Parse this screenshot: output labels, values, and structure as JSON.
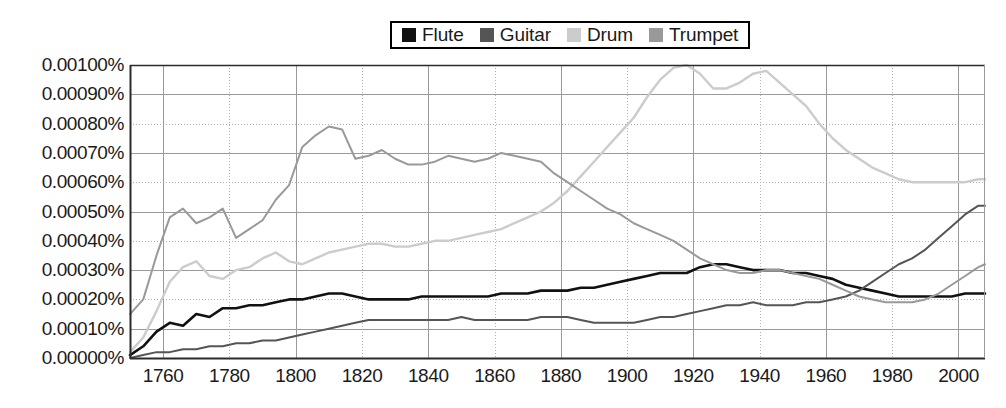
{
  "chart_data": {
    "type": "line",
    "title": "",
    "subtitle": "",
    "xlabel": "",
    "ylabel": "",
    "xlim": [
      1750,
      2008
    ],
    "ylim": [
      0.0,
      0.001
    ],
    "grid": true,
    "legend_position": "top-center",
    "y_tick_labels": [
      "0.00100%",
      "0.00090%",
      "0.00080%",
      "0.00070%",
      "0.00060%",
      "0.00050%",
      "0.00040%",
      "0.00030%",
      "0.00020%",
      "0.00010%",
      "0.00000%"
    ],
    "y_tick_values": [
      0.001,
      0.0009,
      0.0008,
      0.0007,
      0.0006,
      0.0005,
      0.0004,
      0.0003,
      0.0002,
      0.0001,
      0.0
    ],
    "x_tick_labels": [
      "1760",
      "1780",
      "1800",
      "1820",
      "1840",
      "1860",
      "1880",
      "1900",
      "1920",
      "1940",
      "1960",
      "1980",
      "2000"
    ],
    "x_tick_values": [
      1760,
      1780,
      1800,
      1820,
      1840,
      1860,
      1880,
      1900,
      1920,
      1940,
      1960,
      1980,
      2000
    ],
    "x": [
      1750,
      1754,
      1758,
      1762,
      1766,
      1770,
      1774,
      1778,
      1782,
      1786,
      1790,
      1794,
      1798,
      1802,
      1806,
      1810,
      1814,
      1818,
      1822,
      1826,
      1830,
      1834,
      1838,
      1842,
      1846,
      1850,
      1854,
      1858,
      1862,
      1866,
      1870,
      1874,
      1878,
      1882,
      1886,
      1890,
      1894,
      1898,
      1902,
      1906,
      1910,
      1914,
      1918,
      1922,
      1926,
      1930,
      1934,
      1938,
      1942,
      1946,
      1950,
      1954,
      1958,
      1962,
      1966,
      1970,
      1974,
      1978,
      1982,
      1986,
      1990,
      1994,
      1998,
      2002,
      2006,
      2008
    ],
    "series": [
      {
        "name": "Flute",
        "color": "#111111",
        "width": 2.6,
        "values": [
          1e-05,
          4e-05,
          9e-05,
          0.00012,
          0.00011,
          0.00015,
          0.00014,
          0.00017,
          0.00017,
          0.00018,
          0.00018,
          0.00019,
          0.0002,
          0.0002,
          0.00021,
          0.00022,
          0.00022,
          0.00021,
          0.0002,
          0.0002,
          0.0002,
          0.0002,
          0.00021,
          0.00021,
          0.00021,
          0.00021,
          0.00021,
          0.00021,
          0.00022,
          0.00022,
          0.00022,
          0.00023,
          0.00023,
          0.00023,
          0.00024,
          0.00024,
          0.00025,
          0.00026,
          0.00027,
          0.00028,
          0.00029,
          0.00029,
          0.00029,
          0.00031,
          0.00032,
          0.00032,
          0.00031,
          0.0003,
          0.0003,
          0.0003,
          0.00029,
          0.00029,
          0.00028,
          0.00027,
          0.00025,
          0.00024,
          0.00023,
          0.00022,
          0.00021,
          0.00021,
          0.00021,
          0.00021,
          0.00021,
          0.00022,
          0.00022,
          0.00022
        ]
      },
      {
        "name": "Guitar",
        "color": "#555555",
        "width": 2.0,
        "values": [
          0.0,
          1e-05,
          2e-05,
          2e-05,
          3e-05,
          3e-05,
          4e-05,
          4e-05,
          5e-05,
          5e-05,
          6e-05,
          6e-05,
          7e-05,
          8e-05,
          9e-05,
          0.0001,
          0.00011,
          0.00012,
          0.00013,
          0.00013,
          0.00013,
          0.00013,
          0.00013,
          0.00013,
          0.00013,
          0.00014,
          0.00013,
          0.00013,
          0.00013,
          0.00013,
          0.00013,
          0.00014,
          0.00014,
          0.00014,
          0.00013,
          0.00012,
          0.00012,
          0.00012,
          0.00012,
          0.00013,
          0.00014,
          0.00014,
          0.00015,
          0.00016,
          0.00017,
          0.00018,
          0.00018,
          0.00019,
          0.00018,
          0.00018,
          0.00018,
          0.00019,
          0.00019,
          0.0002,
          0.00021,
          0.00023,
          0.00026,
          0.00029,
          0.00032,
          0.00034,
          0.00037,
          0.00041,
          0.00045,
          0.00049,
          0.00052,
          0.00052
        ]
      },
      {
        "name": "Drum",
        "color": "#cccccc",
        "width": 2.4,
        "values": [
          2e-05,
          7e-05,
          0.00016,
          0.00026,
          0.00031,
          0.00033,
          0.00028,
          0.00027,
          0.0003,
          0.00031,
          0.00034,
          0.00036,
          0.00033,
          0.00032,
          0.00034,
          0.00036,
          0.00037,
          0.00038,
          0.00039,
          0.00039,
          0.00038,
          0.00038,
          0.00039,
          0.0004,
          0.0004,
          0.00041,
          0.00042,
          0.00043,
          0.00044,
          0.00046,
          0.00048,
          0.0005,
          0.00053,
          0.00057,
          0.00062,
          0.00067,
          0.00072,
          0.00077,
          0.00082,
          0.00089,
          0.00095,
          0.00099,
          0.001,
          0.00097,
          0.00092,
          0.00092,
          0.00094,
          0.00097,
          0.00098,
          0.00094,
          0.0009,
          0.00086,
          0.0008,
          0.00075,
          0.00071,
          0.00068,
          0.00065,
          0.00063,
          0.00061,
          0.0006,
          0.0006,
          0.0006,
          0.0006,
          0.0006,
          0.00061,
          0.00061
        ]
      },
      {
        "name": "Trumpet",
        "color": "#999999",
        "width": 2.0,
        "values": [
          0.00015,
          0.0002,
          0.00035,
          0.00048,
          0.00051,
          0.00046,
          0.00048,
          0.00051,
          0.00041,
          0.00044,
          0.00047,
          0.00054,
          0.00059,
          0.00072,
          0.00076,
          0.00079,
          0.00078,
          0.00068,
          0.00069,
          0.00071,
          0.00068,
          0.00066,
          0.00066,
          0.00067,
          0.00069,
          0.00068,
          0.00067,
          0.00068,
          0.0007,
          0.00069,
          0.00068,
          0.00067,
          0.00063,
          0.0006,
          0.00057,
          0.00054,
          0.00051,
          0.00049,
          0.00046,
          0.00044,
          0.00042,
          0.0004,
          0.00037,
          0.00034,
          0.00032,
          0.0003,
          0.00029,
          0.00029,
          0.0003,
          0.0003,
          0.00029,
          0.00028,
          0.00027,
          0.00025,
          0.00023,
          0.00021,
          0.0002,
          0.00019,
          0.00019,
          0.00019,
          0.0002,
          0.00022,
          0.00025,
          0.00028,
          0.00031,
          0.00032
        ]
      }
    ]
  },
  "legend": {
    "entries": [
      {
        "label": "Flute"
      },
      {
        "label": "Guitar"
      },
      {
        "label": "Drum"
      },
      {
        "label": "Trumpet"
      }
    ]
  },
  "colors": {
    "flute": "#111111",
    "guitar": "#555555",
    "drum": "#cccccc",
    "trumpet": "#999999",
    "axis": "#2b2b2b",
    "grid_solid": "#9a9a9a",
    "grid_dotted": "#b0b0b0",
    "background": "#ffffff",
    "text": "#1a1a1a"
  }
}
